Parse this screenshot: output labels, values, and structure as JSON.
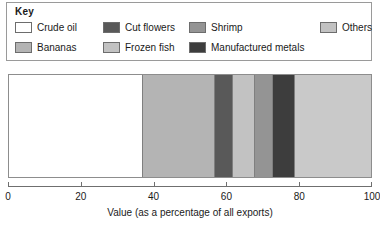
{
  "legend": {
    "title": "Key",
    "items": [
      {
        "label": "Crude oil",
        "color": "#ffffff",
        "row": 0,
        "col": 0
      },
      {
        "label": "Cut flowers",
        "color": "#595959",
        "row": 0,
        "col": 1
      },
      {
        "label": "Shrimp",
        "color": "#949494",
        "row": 0,
        "col": 2
      },
      {
        "label": "Others",
        "color": "#c2c2c2",
        "row": 0,
        "col": 3
      },
      {
        "label": "Bananas",
        "color": "#b4b4b4",
        "row": 1,
        "col": 0
      },
      {
        "label": "Frozen fish",
        "color": "#c2c2c2",
        "row": 1,
        "col": 1
      },
      {
        "label": "Manufactured metals",
        "color": "#3d3d3d",
        "row": 1,
        "col": 2
      }
    ]
  },
  "chart_data": {
    "type": "bar",
    "orientation": "horizontal",
    "stacked": true,
    "title": "",
    "xlabel": "Value (as a percentage of all exports)",
    "ylabel": "",
    "xlim": [
      0,
      100
    ],
    "xticks": [
      0,
      20,
      40,
      60,
      80,
      100
    ],
    "xticklabels": [
      "0",
      "20",
      "40",
      "60",
      "80",
      "100"
    ],
    "grid": false,
    "legend_position": "top",
    "categories": [
      "All exports"
    ],
    "series": [
      {
        "name": "Crude oil",
        "values": [
          37
        ],
        "color": "#ffffff"
      },
      {
        "name": "Bananas",
        "values": [
          20
        ],
        "color": "#b4b4b4"
      },
      {
        "name": "Cut flowers",
        "values": [
          5
        ],
        "color": "#595959"
      },
      {
        "name": "Frozen fish",
        "values": [
          6
        ],
        "color": "#c2c2c2"
      },
      {
        "name": "Shrimp",
        "values": [
          5
        ],
        "color": "#949494"
      },
      {
        "name": "Manufactured metals",
        "values": [
          6
        ],
        "color": "#3d3d3d"
      },
      {
        "name": "Others",
        "values": [
          21
        ],
        "color": "#c9c9c9"
      }
    ],
    "cumulative_boundaries": [
      0,
      37,
      57,
      62,
      68,
      73,
      79,
      100
    ]
  },
  "axis": {
    "title": "Value (as a percentage of all exports)",
    "ticks": [
      {
        "value": 0,
        "label": "0"
      },
      {
        "value": 20,
        "label": "20"
      },
      {
        "value": 40,
        "label": "40"
      },
      {
        "value": 60,
        "label": "60"
      },
      {
        "value": 80,
        "label": "80"
      },
      {
        "value": 100,
        "label": "100"
      }
    ]
  }
}
